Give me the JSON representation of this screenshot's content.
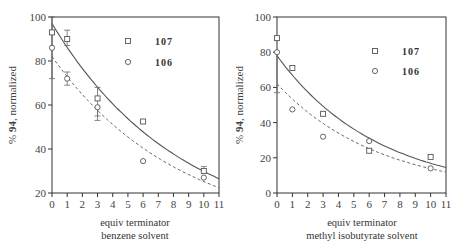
{
  "chart_data": [
    {
      "type": "scatter",
      "title": "",
      "ylabel": "% 94, normalized",
      "ylabel_prefix": "% ",
      "ylabel_bold": "94",
      "ylabel_suffix": ", normalized",
      "xlabel": "equiv terminator",
      "xlabel_line2": "benzene solvent",
      "xlim": [
        0,
        11
      ],
      "ylim": [
        20,
        100
      ],
      "xticks": [
        0,
        1,
        2,
        3,
        4,
        5,
        6,
        7,
        8,
        9,
        10,
        11
      ],
      "yticks": [
        20,
        40,
        60,
        80,
        100
      ],
      "legend_position": "top-right",
      "series": [
        {
          "name": "107",
          "marker": "square",
          "x": [
            0,
            1,
            3,
            6,
            10
          ],
          "y": [
            93,
            90,
            63,
            52.5,
            30
          ],
          "error_low": [
            72,
            87,
            55,
            null,
            null
          ],
          "error_high": [
            100,
            94,
            68,
            null,
            32
          ],
          "fit": {
            "style": "solid",
            "y0": 97,
            "k": 0.118,
            "floor": 0
          }
        },
        {
          "name": "106",
          "marker": "circle",
          "x": [
            0,
            1,
            3,
            6,
            10
          ],
          "y": [
            86,
            72,
            59,
            34.5,
            27
          ],
          "error_low": [
            null,
            69,
            53,
            null,
            null
          ],
          "error_high": [
            null,
            75,
            null,
            null,
            null
          ],
          "fit": {
            "style": "dashed",
            "y0": 82,
            "k": 0.118,
            "floor": 0
          }
        }
      ]
    },
    {
      "type": "scatter",
      "title": "",
      "ylabel": "% 94, normalized",
      "ylabel_prefix": "% ",
      "ylabel_bold": "94",
      "ylabel_suffix": ", normalized",
      "xlabel": "equiv terminator",
      "xlabel_line2": "methyl isobutyrate solvent",
      "xlim": [
        0,
        11
      ],
      "ylim": [
        0,
        100
      ],
      "xticks": [
        0,
        1,
        2,
        3,
        4,
        5,
        6,
        7,
        8,
        9,
        10,
        11
      ],
      "yticks": [
        0,
        20,
        40,
        60,
        80,
        100
      ],
      "legend_position": "top-right",
      "series": [
        {
          "name": "107",
          "marker": "square",
          "x": [
            0,
            1,
            3,
            6,
            10
          ],
          "y": [
            88,
            71,
            45,
            24,
            20.5
          ],
          "error_low": [
            null,
            null,
            null,
            null,
            null
          ],
          "error_high": [
            null,
            null,
            null,
            null,
            null
          ],
          "fit": {
            "style": "solid",
            "y0": 78,
            "k": 0.153,
            "floor": 0
          }
        },
        {
          "name": "106",
          "marker": "circle",
          "x": [
            0,
            1,
            3,
            6,
            10
          ],
          "y": [
            80,
            47.5,
            32,
            29.5,
            14
          ],
          "error_low": [
            57,
            null,
            null,
            null,
            null
          ],
          "error_high": [
            null,
            null,
            null,
            null,
            null
          ],
          "fit": {
            "style": "dashed",
            "y0": 62,
            "k": 0.15,
            "floor": 0
          }
        }
      ]
    }
  ]
}
